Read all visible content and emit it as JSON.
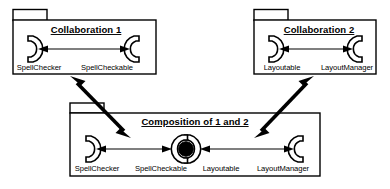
{
  "diagram": {
    "kind": "uml-collaboration-composition-diagram",
    "background_color": "#ffffff",
    "line_color": "#000000",
    "packages": [
      {
        "id": "collaboration-1",
        "title": "Collaboration 1",
        "ports": [
          {
            "label": "SpellChecker",
            "icon": "socket-left-icon"
          },
          {
            "label": "SpellCheckable",
            "icon": "socket-right-icon"
          }
        ],
        "connector": {
          "type": "double-headed-arrow",
          "style": "thin"
        }
      },
      {
        "id": "collaboration-2",
        "title": "Collaboration 2",
        "ports": [
          {
            "label": "Layoutable",
            "icon": "socket-left-icon"
          },
          {
            "label": "LayoutManager",
            "icon": "socket-right-icon"
          }
        ],
        "connector": {
          "type": "double-headed-arrow",
          "style": "thin"
        }
      },
      {
        "id": "composition-of-1-and-2",
        "title": "Composition of 1 and 2",
        "ports": [
          {
            "label": "SpellChecker",
            "icon": "socket-left-icon"
          },
          {
            "label": "SpellCheckable",
            "icon": "merged-ball-socket-icon"
          },
          {
            "label": "Layoutable",
            "icon": "merged-ball-socket-icon"
          },
          {
            "label": "LayoutManager",
            "icon": "socket-right-icon"
          }
        ],
        "connector": {
          "type": "double-headed-arrow",
          "style": "thin"
        }
      }
    ],
    "relations": [
      {
        "id": "rel-collab1-composition",
        "from": "collaboration-1",
        "to": "composition-of-1-and-2",
        "type": "double-headed-arrow",
        "style": "thick"
      },
      {
        "id": "rel-collab2-composition",
        "from": "collaboration-2",
        "to": "composition-of-1-and-2",
        "type": "double-headed-arrow",
        "style": "thick"
      }
    ]
  }
}
